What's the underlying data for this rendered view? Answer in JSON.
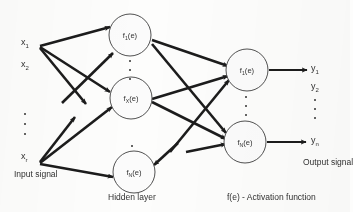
{
  "figure": {
    "bg_color": "#fdfdfc",
    "ink_color": "#141414"
  },
  "input_layer": {
    "name": "Input signal",
    "caption": "Input signal",
    "labels": [
      {
        "base": "x",
        "sub": "1",
        "text": "x1"
      },
      {
        "base": "x",
        "sub": "2",
        "text": "x2"
      },
      {
        "base": "x",
        "sub": "r",
        "text": "xr"
      }
    ],
    "ellipsis": "vertical-dots"
  },
  "hidden_layer": {
    "caption": "Hidden layer",
    "nodes": [
      {
        "base": "f",
        "sub": "1",
        "arg": "(e)",
        "text": "f1(e)"
      },
      {
        "base": "f",
        "sub": "X",
        "arg": "(e)",
        "text": "fX(e)"
      },
      {
        "base": "f",
        "sub": "N",
        "arg": "(e)",
        "text": "fN(e)"
      }
    ],
    "ellipsis": "vertical-dots"
  },
  "output_layer": {
    "caption": "Output signal",
    "nodes": [
      {
        "base": "f",
        "sub": "1",
        "arg": "(e)",
        "text": "f1(e)"
      },
      {
        "base": "f",
        "sub": "N",
        "arg": "(e)",
        "text": "fN(e)"
      }
    ],
    "labels": [
      {
        "base": "y",
        "sub": "1",
        "text": "y1"
      },
      {
        "base": "y",
        "sub": "2",
        "text": "y2"
      },
      {
        "base": "y",
        "sub": "n",
        "text": "yn"
      }
    ],
    "ellipsis": "vertical-dots"
  },
  "legend": {
    "activation_note": "f(e) - Activation function"
  }
}
